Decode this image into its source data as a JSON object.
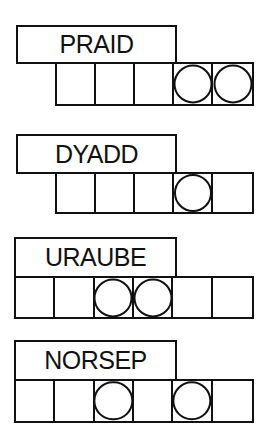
{
  "game": {
    "type": "word-jumble",
    "puzzles": [
      {
        "scrambled": "PRAID",
        "cell_count": 5,
        "circled_cells": [
          3,
          4
        ],
        "layout": {
          "box_left": 16,
          "box_top": 25,
          "box_width": 161,
          "box_height": 39,
          "cells_left": 55,
          "cells_top": 62,
          "cells_width": 199,
          "cells_height": 44
        }
      },
      {
        "scrambled": "DYADD",
        "cell_count": 5,
        "circled_cells": [
          3
        ],
        "layout": {
          "box_left": 16,
          "box_top": 134,
          "box_width": 161,
          "box_height": 40,
          "cells_left": 55,
          "cells_top": 172,
          "cells_width": 199,
          "cells_height": 42
        }
      },
      {
        "scrambled": "URAUBE",
        "cell_count": 6,
        "circled_cells": [
          2,
          3
        ],
        "layout": {
          "box_left": 14,
          "box_top": 237,
          "box_width": 163,
          "box_height": 41,
          "cells_left": 14,
          "cells_top": 276,
          "cells_width": 240,
          "cells_height": 43
        }
      },
      {
        "scrambled": "NORSEP",
        "cell_count": 6,
        "circled_cells": [
          2,
          4
        ],
        "layout": {
          "box_left": 14,
          "box_top": 340,
          "box_width": 163,
          "box_height": 41,
          "cells_left": 14,
          "cells_top": 379,
          "cells_width": 240,
          "cells_height": 44
        }
      }
    ]
  }
}
